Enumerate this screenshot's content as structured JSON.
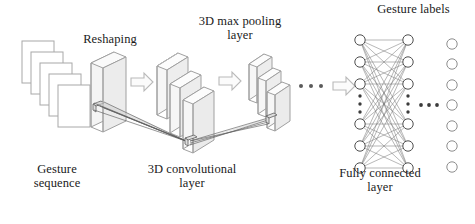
{
  "figure": {
    "kind": "diagram",
    "title_text": "",
    "background_color": "#ffffff",
    "line_color": "#9a9a9a",
    "dark_line_color": "#4a4a4a",
    "face_fill": "#f2f2f2",
    "text_color": "#1a1a1a"
  },
  "labels": {
    "gesture_sequence": "Gesture\nsequence",
    "reshaping": "Reshaping",
    "conv_layer": "3D convolutional\nlayer",
    "max_pool_layer": "3D max pooling\nlayer",
    "fully_connected": "Fully connected\nlayer",
    "gesture_labels": "Gesture labels"
  },
  "pipeline": {
    "stages": [
      {
        "name": "gesture-sequence",
        "label": "Gesture sequence",
        "shape": "stacked-frames",
        "count": 5
      },
      {
        "name": "reshaping",
        "label": "Reshaping",
        "shape": "cuboid",
        "count": 1
      },
      {
        "name": "conv-layer",
        "label": "3D convolutional layer",
        "shape": "cascaded-cuboids",
        "count": 3
      },
      {
        "name": "max-pool-layer",
        "label": "3D max pooling layer",
        "shape": "cascaded-cuboids",
        "count": 3
      },
      {
        "name": "fully-connected",
        "label": "Fully connected layer",
        "shape": "node-columns",
        "count": 2
      },
      {
        "name": "gesture-labels",
        "label": "Gesture labels",
        "shape": "node-column",
        "count": 7
      }
    ],
    "arrows": [
      {
        "name": "arrow-seq-to-reshape",
        "glyph": "block-arrow-right"
      },
      {
        "name": "arrow-reshape-to-conv",
        "glyph": "block-arrow-right"
      },
      {
        "name": "arrow-conv-to-pool",
        "glyph": "block-arrow-right"
      },
      {
        "name": "arrow-pool-to-fc",
        "glyph": "block-arrow-right"
      }
    ],
    "ellipses": [
      {
        "name": "ellipsis-after-pool",
        "glyph": "horizontal-dots",
        "dots": 3
      },
      {
        "name": "ellipsis-fc-left-column",
        "glyph": "vertical-dots",
        "dots": 3
      },
      {
        "name": "ellipsis-fc-right-column",
        "glyph": "vertical-dots",
        "dots": 3
      },
      {
        "name": "ellipsis-fc-to-labels",
        "glyph": "horizontal-dots",
        "dots": 3
      }
    ]
  },
  "fully_connected_layer": {
    "columns": [
      {
        "name": "fc-column-left",
        "visible_nodes": 6,
        "top_nodes": 3,
        "bottom_nodes": 3,
        "has_vertical_ellipsis": true
      },
      {
        "name": "fc-column-right",
        "visible_nodes": 6,
        "top_nodes": 3,
        "bottom_nodes": 3,
        "has_vertical_ellipsis": true
      }
    ],
    "connections": "all-to-all"
  },
  "gesture_labels_column": {
    "name": "output-nodes",
    "nodes": 7
  }
}
